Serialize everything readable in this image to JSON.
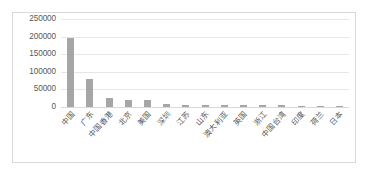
{
  "chart_data": {
    "type": "bar",
    "title": "",
    "subtitle": "",
    "xlabel": "",
    "ylabel": "",
    "ylim": [
      0,
      250000
    ],
    "yticks": [
      "0",
      "50000",
      "100000",
      "150000",
      "200000",
      "250000"
    ],
    "ytick_values": [
      0,
      50000,
      100000,
      150000,
      200000,
      250000
    ],
    "grid": true,
    "legend": "none",
    "bar_color": "#a6a6a6",
    "categories": [
      "中国",
      "广东",
      "中国香港",
      "北京",
      "美国",
      "深圳",
      "江苏",
      "山东",
      "澳大利亚",
      "英国",
      "浙江",
      "中国台湾",
      "印度",
      "荷兰",
      "日本"
    ],
    "values": [
      196000,
      79000,
      27000,
      20000,
      19000,
      8000,
      7000,
      6500,
      6000,
      5500,
      5000,
      4500,
      4000,
      3800,
      3500
    ]
  },
  "card": {
    "border_color": "#d9d9d9",
    "background": "#ffffff"
  }
}
